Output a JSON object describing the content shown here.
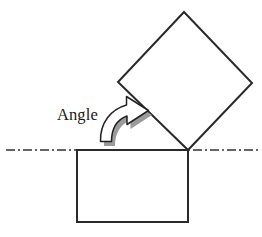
{
  "figure": {
    "label": "Angle",
    "faint_background_text": "",
    "colors": {
      "stroke": "#2a2a2a",
      "shape_fill": "#ffffff",
      "arrow_fill": "#ffffff",
      "arrow_stroke": "#222222",
      "arrow_shadow": "#9a9a9a",
      "reference_line": "#333333",
      "label_color": "#1a1a1a",
      "background": "#ffffff"
    },
    "elements": {
      "base_rectangle": {
        "name": "base-rectangle",
        "x": 77,
        "y": 150,
        "width": 111,
        "height": 72,
        "stroke_width": 2
      },
      "rotated_square": {
        "name": "rotated-square",
        "points": "184,12 252,83 188,150 118,82",
        "stroke_width": 2,
        "rotation_pivot": "188,150"
      },
      "reference_line": {
        "name": "horizontal-reference-line",
        "x1": 6,
        "y1": 150,
        "x2": 260,
        "y2": 150,
        "stroke_width": 1.4,
        "dash_pattern": "9 3 2 3"
      },
      "angle_arrow": {
        "name": "curved-rotation-arrow",
        "direction": "counterclockwise-to-clockwise-sweep",
        "shadow_offset_x": 3,
        "shadow_offset_y": 4
      },
      "angle_label": {
        "name": "angle-text-label",
        "x": 57,
        "y": 120
      }
    }
  }
}
